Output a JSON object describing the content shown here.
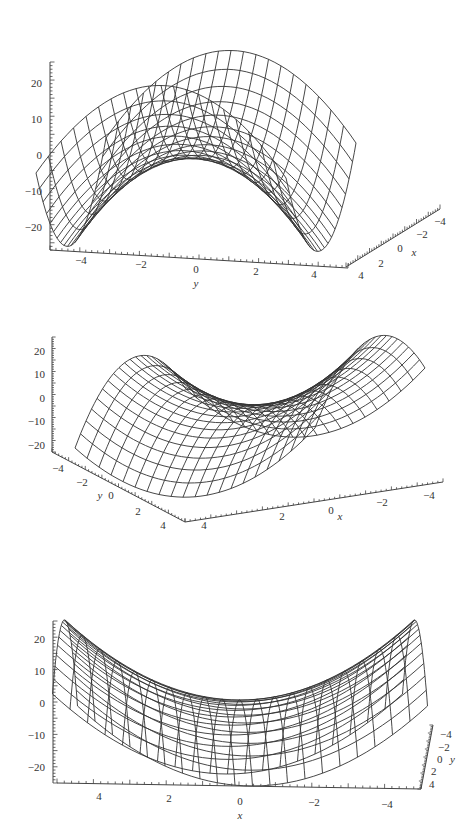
{
  "figure": {
    "background": "#ffffff",
    "line_color": "#333333",
    "panels": [
      {
        "id": "view-1",
        "z_axis": {
          "ticks": [
            20,
            10,
            0,
            -10,
            -20
          ],
          "tick_labels": [
            "20",
            "10",
            "0",
            "−10",
            "−20"
          ]
        },
        "horizontal_axis": {
          "name": "y",
          "tick_labels": [
            "−4",
            "−2",
            "0",
            "2",
            "4"
          ]
        },
        "depth_axis": {
          "name": "x",
          "tick_labels": [
            "4",
            "2",
            "0",
            "−2",
            "−4"
          ]
        }
      },
      {
        "id": "view-2",
        "z_axis": {
          "ticks": [
            20,
            10,
            0,
            -10,
            -20
          ],
          "tick_labels": [
            "20",
            "10",
            "0",
            "−10",
            "−20"
          ]
        },
        "depth_axis": {
          "name": "y",
          "tick_labels": [
            "−4",
            "−2",
            "0",
            "2",
            "4"
          ]
        },
        "horizontal_axis": {
          "name": "x",
          "tick_labels": [
            "4",
            "2",
            "0",
            "−2",
            "−4"
          ]
        }
      },
      {
        "id": "view-3",
        "z_axis": {
          "ticks": [
            20,
            10,
            0,
            -10,
            -20
          ],
          "tick_labels": [
            "20",
            "10",
            "0",
            "−10",
            "−20"
          ]
        },
        "horizontal_axis": {
          "name": "x",
          "tick_labels": [
            "4",
            "2",
            "0",
            "−2",
            "−4"
          ]
        },
        "depth_axis": {
          "name": "y",
          "tick_labels": [
            "−4",
            "−2",
            "0",
            "2",
            "4"
          ]
        }
      }
    ]
  },
  "chart_data": [
    {
      "type": "surface",
      "title": "",
      "function": "z = x^2 - y^2",
      "x_range": [
        -5,
        5
      ],
      "y_range": [
        -5,
        5
      ],
      "z_range": [
        -25,
        25
      ],
      "view": "looking along x, y axis horizontal",
      "xlabel": "x",
      "ylabel": "y",
      "zlabel": "",
      "x_ticks": [
        -4,
        -2,
        0,
        2,
        4
      ],
      "y_ticks": [
        -4,
        -2,
        0,
        2,
        4
      ],
      "z_ticks": [
        -20,
        -10,
        0,
        10,
        20
      ],
      "grid": false
    },
    {
      "type": "surface",
      "title": "",
      "function": "z = x^2 - y^2",
      "x_range": [
        -5,
        5
      ],
      "y_range": [
        -5,
        5
      ],
      "z_range": [
        -25,
        25
      ],
      "view": "oblique, x axis horizontal, y axis receding to lower-left",
      "xlabel": "x",
      "ylabel": "y",
      "zlabel": "",
      "x_ticks": [
        -4,
        -2,
        0,
        2,
        4
      ],
      "y_ticks": [
        -4,
        -2,
        0,
        2,
        4
      ],
      "z_ticks": [
        -20,
        -10,
        0,
        10,
        20
      ],
      "grid": false
    },
    {
      "type": "surface",
      "title": "",
      "function": "z = x^2 - y^2",
      "x_range": [
        -5,
        5
      ],
      "y_range": [
        -5,
        5
      ],
      "z_range": [
        -25,
        25
      ],
      "view": "looking along y, x axis horizontal",
      "xlabel": "x",
      "ylabel": "y",
      "zlabel": "",
      "x_ticks": [
        -4,
        -2,
        0,
        2,
        4
      ],
      "y_ticks": [
        -4,
        -2,
        0,
        2,
        4
      ],
      "z_ticks": [
        -20,
        -10,
        0,
        10,
        20
      ],
      "grid": false
    }
  ]
}
